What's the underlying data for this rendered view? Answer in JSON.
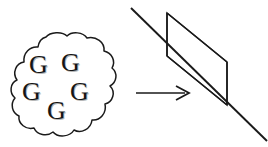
{
  "figure": {
    "background_color": "#ffffff",
    "stroke_color": "#1a1a1a",
    "letter_color": "#151515",
    "letter_shadow_color": "#787878"
  },
  "cloud": {
    "label": "cloud-shape",
    "letters": [
      {
        "char": "G",
        "x": 29,
        "y": 52
      },
      {
        "char": "G",
        "x": 61,
        "y": 50
      },
      {
        "char": "G",
        "x": 22,
        "y": 79
      },
      {
        "char": "G",
        "x": 70,
        "y": 79
      },
      {
        "char": "G",
        "x": 47,
        "y": 98
      }
    ],
    "letter_count": 5,
    "bounds": {
      "left": 14,
      "top": 34,
      "right": 117,
      "bottom": 138
    }
  },
  "arrow": {
    "label": "rightward-arrow",
    "from_x": 136,
    "to_x": 189,
    "y": 93
  },
  "plane": {
    "label": "parallelogram-plane",
    "points": "167,13 227,62 227,105 167,56",
    "left_edge": {
      "x": 167,
      "y1": 13,
      "y2": 56
    },
    "right_edge": {
      "x": 227,
      "y1": 62,
      "y2": 105
    }
  },
  "diagonal": {
    "label": "diagonal-line",
    "x1": 131,
    "y1": 8,
    "x2": 267,
    "y2": 141
  }
}
